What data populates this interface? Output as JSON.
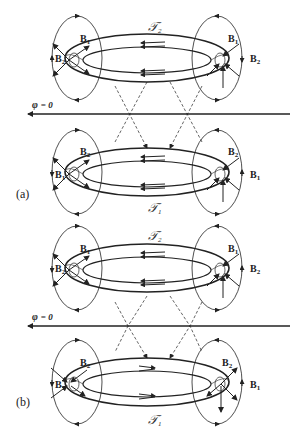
{
  "figure": {
    "panels": [
      {
        "id": "a",
        "label": "(a)",
        "upper_ring": {
          "torus_label": "𝒯",
          "torus_sub": "2",
          "left_field_labels": {
            "outer": "B",
            "outer_sub": "1",
            "side": "B",
            "side_sub": "2"
          },
          "right_field_labels": {
            "outer": "B",
            "outer_sub": "1",
            "side": "B",
            "side_sub": "2"
          },
          "current_direction": "left"
        },
        "lower_ring": {
          "torus_label": "𝒯",
          "torus_sub": "1",
          "left_field_labels": {
            "outer": "B",
            "outer_sub": "2",
            "side": "B",
            "side_sub": "1"
          },
          "right_field_labels": {
            "outer": "B",
            "outer_sub": "2",
            "side": "B",
            "side_sub": "1"
          },
          "current_direction": "left"
        },
        "axis": {
          "symbol": "φ",
          "value": "= 0"
        }
      },
      {
        "id": "b",
        "label": "(b)",
        "upper_ring": {
          "torus_label": "𝒯",
          "torus_sub": "2",
          "left_field_labels": {
            "outer": "B",
            "outer_sub": "1",
            "side": "B",
            "side_sub": "2"
          },
          "right_field_labels": {
            "outer": "B",
            "outer_sub": "1",
            "side": "B",
            "side_sub": "2"
          },
          "current_direction": "left"
        },
        "lower_ring": {
          "torus_label": "𝒯",
          "torus_sub": "1",
          "left_field_labels": {
            "outer": "B",
            "outer_sub": "2",
            "side": "B",
            "side_sub": "1"
          },
          "right_field_labels": {
            "outer": "B",
            "outer_sub": "2",
            "side": "B",
            "side_sub": "1"
          },
          "current_direction": "right"
        },
        "axis": {
          "symbol": "φ",
          "value": "= 0"
        }
      }
    ]
  }
}
